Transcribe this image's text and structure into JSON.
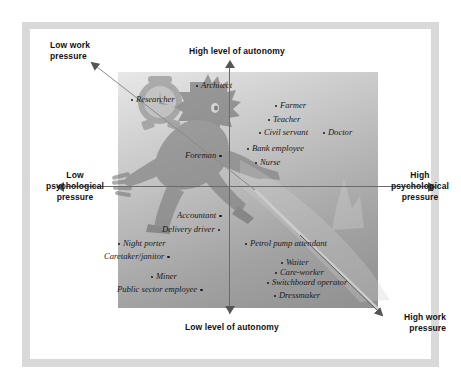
{
  "diagram": {
    "axes": {
      "top": "High level of autonomy",
      "bottom": "Low level of autonomy",
      "left": "Low\npsychological\npressure",
      "left_line1": "Low",
      "left_line2": "psychological",
      "left_line3": "pressure",
      "right_line1": "High",
      "right_line2": "psychological",
      "right_line3": "pressure",
      "diag_top_left_line1": "Low work",
      "diag_top_left_line2": "pressure",
      "diag_bottom_right_line1": "High work",
      "diag_bottom_right_line2": "pressure"
    },
    "colors": {
      "frame": "#d9d9d9",
      "panel_light": "#e8e8e8",
      "panel_dark": "#8f8f8f",
      "axis": "#6b6b6b",
      "text": "#1a1a1a"
    },
    "occupations": [
      {
        "label": "Architect",
        "x": 196,
        "y": 80,
        "dot": "lead"
      },
      {
        "label": "Researcher",
        "x": 131,
        "y": 94,
        "dot": "lead"
      },
      {
        "label": "Farmer",
        "x": 275,
        "y": 100,
        "dot": "lead"
      },
      {
        "label": "Teacher",
        "x": 268,
        "y": 114,
        "dot": "lead"
      },
      {
        "label": "Civil servant",
        "x": 259,
        "y": 127,
        "dot": "lead"
      },
      {
        "label": "Doctor",
        "x": 323,
        "y": 127,
        "dot": "lead"
      },
      {
        "label": "Bank employee",
        "x": 247,
        "y": 143,
        "dot": "lead"
      },
      {
        "label": "Foreman",
        "x": 185,
        "y": 150,
        "dot": "trail"
      },
      {
        "label": "Nurse",
        "x": 255,
        "y": 157,
        "dot": "lead"
      },
      {
        "label": "Accountant",
        "x": 177,
        "y": 210,
        "dot": "trail"
      },
      {
        "label": "Delivery driver",
        "x": 162,
        "y": 224,
        "dot": "trail"
      },
      {
        "label": "Night porter",
        "x": 118,
        "y": 238,
        "dot": "lead"
      },
      {
        "label": "Petrol pump attendant",
        "x": 245,
        "y": 238,
        "dot": "lead"
      },
      {
        "label": "Caretaker/janitor",
        "x": 104,
        "y": 251,
        "dot": "trail"
      },
      {
        "label": "Waiter",
        "x": 281,
        "y": 257,
        "dot": "lead"
      },
      {
        "label": "Care-worker",
        "x": 275,
        "y": 267,
        "dot": "lead"
      },
      {
        "label": "Miner",
        "x": 151,
        "y": 271,
        "dot": "lead"
      },
      {
        "label": "Switchboard operator",
        "x": 267,
        "y": 277,
        "dot": "lead"
      },
      {
        "label": "Public sector employee",
        "x": 117,
        "y": 284,
        "dot": "trail"
      },
      {
        "label": "Dressmaker",
        "x": 274,
        "y": 290,
        "dot": "lead"
      }
    ]
  },
  "chart_data": {
    "type": "scatter",
    "xlabel": "Psychological pressure (low → high)",
    "ylabel": "Level of autonomy (low → high)",
    "grid": false,
    "legend": "none",
    "annotations": [
      "High level of autonomy",
      "Low level of autonomy",
      "Low psychological pressure",
      "High psychological pressure",
      "Low work pressure",
      "High work pressure"
    ],
    "points": [
      {
        "label": "Architect",
        "quadrant": "upper-left",
        "psychological_pressure": -0.13,
        "autonomy": 0.93
      },
      {
        "label": "Researcher",
        "quadrant": "upper-left",
        "psychological_pressure": -0.67,
        "autonomy": 0.8
      },
      {
        "label": "Farmer",
        "quadrant": "upper-right",
        "psychological_pressure": 0.28,
        "autonomy": 0.73
      },
      {
        "label": "Teacher",
        "quadrant": "upper-right",
        "psychological_pressure": 0.23,
        "autonomy": 0.61
      },
      {
        "label": "Civil servant",
        "quadrant": "upper-right",
        "psychological_pressure": 0.18,
        "autonomy": 0.5
      },
      {
        "label": "Doctor",
        "quadrant": "upper-right",
        "psychological_pressure": 0.72,
        "autonomy": 0.5
      },
      {
        "label": "Bank employee",
        "quadrant": "upper-right",
        "psychological_pressure": 0.12,
        "autonomy": 0.36
      },
      {
        "label": "Foreman",
        "quadrant": "upper-left",
        "psychological_pressure": -0.02,
        "autonomy": 0.3
      },
      {
        "label": "Nurse",
        "quadrant": "upper-right",
        "psychological_pressure": 0.19,
        "autonomy": 0.24
      },
      {
        "label": "Accountant",
        "quadrant": "lower-left",
        "psychological_pressure": -0.01,
        "autonomy": -0.2
      },
      {
        "label": "Delivery driver",
        "quadrant": "lower-left",
        "psychological_pressure": -0.04,
        "autonomy": -0.32
      },
      {
        "label": "Night porter",
        "quadrant": "lower-left",
        "psychological_pressure": -0.56,
        "autonomy": -0.44
      },
      {
        "label": "Petrol pump attendant",
        "quadrant": "lower-right",
        "psychological_pressure": 0.13,
        "autonomy": -0.44
      },
      {
        "label": "Caretaker/janitor",
        "quadrant": "lower-left",
        "psychological_pressure": -0.25,
        "autonomy": -0.55
      },
      {
        "label": "Waiter",
        "quadrant": "lower-right",
        "psychological_pressure": 0.33,
        "autonomy": -0.6
      },
      {
        "label": "Care-worker",
        "quadrant": "lower-right",
        "psychological_pressure": 0.28,
        "autonomy": -0.69
      },
      {
        "label": "Miner",
        "quadrant": "lower-left",
        "psychological_pressure": -0.37,
        "autonomy": -0.72
      },
      {
        "label": "Switchboard operator",
        "quadrant": "lower-right",
        "psychological_pressure": 0.22,
        "autonomy": -0.77
      },
      {
        "label": "Public sector employee",
        "quadrant": "lower-left",
        "psychological_pressure": -0.14,
        "autonomy": -0.83
      },
      {
        "label": "Dressmaker",
        "quadrant": "lower-right",
        "psychological_pressure": 0.27,
        "autonomy": -0.88
      }
    ]
  }
}
